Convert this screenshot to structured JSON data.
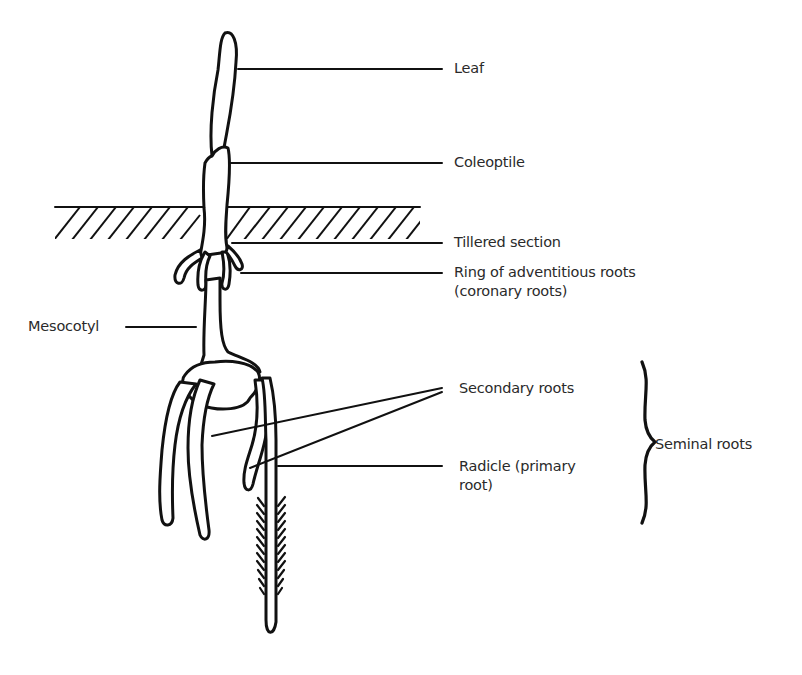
{
  "diagram": {
    "type": "labeled-illustration",
    "labels": {
      "leaf": "Leaf",
      "coleoptile": "Coleoptile",
      "tillered_section": "Tillered section",
      "adventitious_line1": "Ring of adventitious roots",
      "adventitious_line2": "(coronary roots)",
      "mesocotyl": "Mesocotyl",
      "secondary_roots": "Secondary roots",
      "radicle_line1": "Radicle (primary",
      "radicle_line2": "root)",
      "seminal_roots": "Seminal roots"
    },
    "groupings": [
      {
        "bracket": "Seminal roots",
        "members": [
          "Secondary roots",
          "Radicle (primary root)"
        ]
      }
    ],
    "colors": {
      "ink": "#111111",
      "text": "#2a2a2a",
      "background": "#ffffff"
    }
  }
}
